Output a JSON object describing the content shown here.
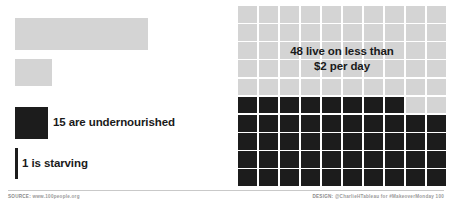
{
  "left_panel": {
    "bars": [
      {
        "name": "total",
        "label": "",
        "value": 100,
        "color": "#d4d4d4"
      },
      {
        "name": "live-on-less",
        "label": "",
        "value": 48,
        "color": "#d4d4d4"
      },
      {
        "name": "undernourished",
        "label": "15 are undernourished",
        "value": 15,
        "color": "#1c1c1c"
      },
      {
        "name": "starving",
        "label": "1 is starving",
        "value": 1,
        "color": "#1c1c1c"
      }
    ],
    "label_undernourished": "15 are undernourished",
    "label_starving": "1 is starving"
  },
  "right_panel": {
    "annotation_line1": "48 live on less than",
    "annotation_line2": "$2 per day",
    "highlighted_count": 48,
    "total_count": 100
  },
  "footer": {
    "source_key": "SOURCE:",
    "source_value": "www.100people.org",
    "design_key": "DESIGN:",
    "design_value": "@CharlieHTableau for #MakeoverMonday 100"
  },
  "chart_data": {
    "type": "bar",
    "title": "",
    "subtitle": "",
    "xlabel": "",
    "ylabel": "",
    "categories": [
      "Total population",
      "Live on less than $2 per day",
      "Are undernourished",
      "Is starving"
    ],
    "values": [
      100,
      48,
      15,
      1
    ],
    "unit": "people per 100",
    "ylim": [
      0,
      100
    ],
    "grid": false,
    "legend": "none",
    "annotations": [
      "48 live on less than $2 per day",
      "15 are undernourished",
      "1 is starving"
    ],
    "waffle": {
      "type": "heatmap",
      "rows": 10,
      "columns": 10,
      "filled": 48,
      "empty": 52,
      "filled_color": "#1c1c1c",
      "empty_color": "#d4d4d4"
    }
  }
}
